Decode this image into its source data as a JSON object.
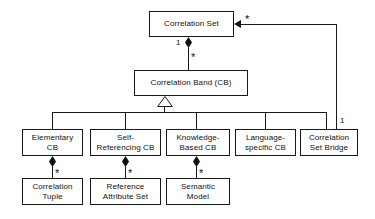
{
  "diagram": {
    "type": "uml-class-diagram",
    "line_color": "#1a1a1a",
    "box_fill": "#ffffff",
    "text_color": "#111111",
    "classes": [
      {
        "id": "correlation-set",
        "label": "Correlation Set"
      },
      {
        "id": "correlation-band",
        "label": "Correlation Band (CB)"
      },
      {
        "id": "elementary-cb",
        "label": "Elementary\nCB"
      },
      {
        "id": "self-referencing-cb",
        "label": "Self-\nReferencing CB"
      },
      {
        "id": "knowledge-based-cb",
        "label": "Knowledge-\nBased CB"
      },
      {
        "id": "language-specific-cb",
        "label": "Language-\nspecific CB"
      },
      {
        "id": "correlation-set-bridge",
        "label": "Correlation\nSet Bridge"
      },
      {
        "id": "correlation-tuple",
        "label": "Correlation\nTuple"
      },
      {
        "id": "reference-attribute-set",
        "label": "Reference\nAttribute Set"
      },
      {
        "id": "semantic-model",
        "label": "Semantic\nModel"
      }
    ],
    "multiplicities": {
      "set_to_band_parent": "1",
      "set_to_band_child": "*",
      "bridge_to_set_target": "*",
      "bridge_to_set_source": "1",
      "elementary_to_tuple": "*",
      "selfref_to_refattr": "*",
      "knowledge_to_semantic": "*"
    },
    "relations": [
      {
        "kind": "composition",
        "from": "correlation-set",
        "to": "correlation-band",
        "from_mult": "1",
        "to_mult": "*"
      },
      {
        "kind": "generalization",
        "from": "correlation-band",
        "to": "elementary-cb"
      },
      {
        "kind": "generalization",
        "from": "correlation-band",
        "to": "self-referencing-cb"
      },
      {
        "kind": "generalization",
        "from": "correlation-band",
        "to": "knowledge-based-cb"
      },
      {
        "kind": "generalization",
        "from": "correlation-band",
        "to": "language-specific-cb"
      },
      {
        "kind": "generalization",
        "from": "correlation-band",
        "to": "correlation-set-bridge"
      },
      {
        "kind": "composition",
        "from": "elementary-cb",
        "to": "correlation-tuple",
        "to_mult": "*"
      },
      {
        "kind": "composition",
        "from": "self-referencing-cb",
        "to": "reference-attribute-set",
        "to_mult": "*"
      },
      {
        "kind": "composition",
        "from": "knowledge-based-cb",
        "to": "semantic-model",
        "to_mult": "*"
      },
      {
        "kind": "association",
        "from": "correlation-set-bridge",
        "to": "correlation-set",
        "from_mult": "1",
        "to_mult": "*"
      }
    ]
  }
}
